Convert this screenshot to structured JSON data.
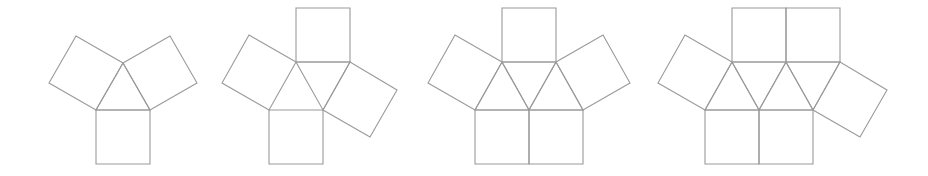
{
  "figure": {
    "background_color": "#ffffff",
    "stroke_color": "#9a9a9a",
    "stroke_width": 1.1,
    "fill": "none",
    "canvas": {
      "width": 928,
      "height": 176
    }
  },
  "chart_data": {
    "type": "diagram",
    "xlabel": "",
    "ylabel": "",
    "count": 4,
    "edge_length": 54,
    "triangle_height": 47,
    "items": [
      {
        "index": 1,
        "name": "net-1",
        "label": "",
        "triangle_count": 1,
        "square_count": 3,
        "polygon_count": 4
      },
      {
        "index": 2,
        "name": "net-2",
        "label": "",
        "triangle_count": 1,
        "square_count": 4,
        "polygon_count": 5
      },
      {
        "index": 3,
        "name": "net-3",
        "label": "",
        "triangle_count": 3,
        "square_count": 4,
        "polygon_count": 7
      },
      {
        "index": 4,
        "name": "net-4",
        "label": "",
        "triangle_count": 4,
        "square_count": 5,
        "polygon_count": 9
      }
    ]
  },
  "shapes": {
    "net_1": {
      "name": "net-1",
      "triangles": [
        {
          "name": "triangle-center",
          "points": "96,110 150,110 123,63"
        }
      ],
      "squares": [
        {
          "name": "square-bottom",
          "points": "96,110 150,110 150,164 96,164"
        },
        {
          "name": "square-upper-left",
          "points": "96,110 123,63 76,36 49,83"
        },
        {
          "name": "square-upper-right",
          "points": "150,110 123,63 170,36 197,83"
        }
      ]
    },
    "net_2": {
      "name": "net-2",
      "triangles": [
        {
          "name": "triangle-center",
          "points": "296,62 350,62 323,110"
        }
      ],
      "squares": [
        {
          "name": "square-top",
          "points": "296,62 350,62 350,8 296,8"
        },
        {
          "name": "square-bottom",
          "points": "269,110 323,110 323,164 269,164"
        },
        {
          "name": "square-upper-left",
          "points": "296,62 269,110 222,83 249,35"
        },
        {
          "name": "square-lower-right",
          "points": "350,62 323,110 370,137 397,90"
        }
      ]
    },
    "net_3": {
      "name": "net-3",
      "triangles": [
        {
          "name": "triangle-left-up",
          "points": "475,110 529,110 502,62"
        },
        {
          "name": "triangle-center-down",
          "points": "502,62 556,62 529,110"
        },
        {
          "name": "triangle-right-up",
          "points": "529,110 583,110 556,62"
        }
      ],
      "squares": [
        {
          "name": "square-top",
          "points": "502,62 556,62 556,8 502,8"
        },
        {
          "name": "square-bottom-left",
          "points": "475,110 529,110 529,164 475,164"
        },
        {
          "name": "square-bottom-right",
          "points": "529,110 583,110 583,164 529,164"
        },
        {
          "name": "square-upper-left",
          "points": "502,62 475,110 428,83 455,35"
        },
        {
          "name": "square-upper-right",
          "points": "556,62 583,110 630,83 603,35"
        }
      ]
    },
    "net_4": {
      "name": "net-4",
      "triangles": [
        {
          "name": "triangle-1-up",
          "points": "705,110 759,110 732,62"
        },
        {
          "name": "triangle-2-down",
          "points": "732,62 786,62 759,110"
        },
        {
          "name": "triangle-3-up",
          "points": "759,110 813,110 786,62"
        },
        {
          "name": "triangle-4-down",
          "points": "786,62 840,62 813,110"
        }
      ],
      "squares": [
        {
          "name": "square-top-left",
          "points": "732,62 786,62 786,8 732,8"
        },
        {
          "name": "square-top-right",
          "points": "786,62 840,62 840,8 786,8"
        },
        {
          "name": "square-bottom-left",
          "points": "705,110 759,110 759,164 705,164"
        },
        {
          "name": "square-bottom-right",
          "points": "759,110 813,110 813,164 759,164"
        },
        {
          "name": "square-upper-left",
          "points": "732,62 705,110 658,83 685,35"
        },
        {
          "name": "square-lower-right",
          "points": "840,62 813,110 860,137 887,90"
        }
      ]
    }
  }
}
